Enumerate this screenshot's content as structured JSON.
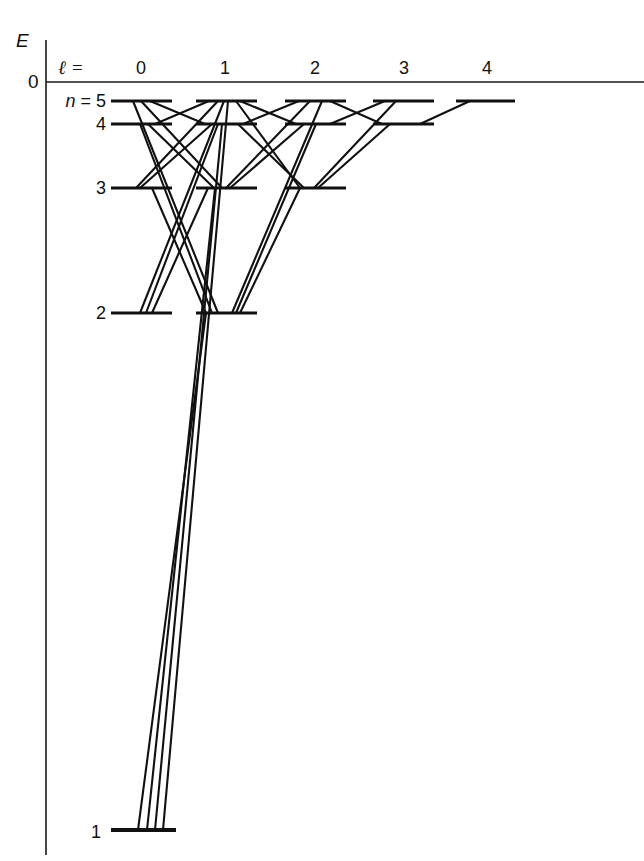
{
  "figure": {
    "kind": "grotrian-energy-level-diagram",
    "axis": {
      "energy_label": "E",
      "zero_label": "0",
      "ell_label": "ℓ",
      "ell_equals": "=",
      "ell_label_full": "ℓ ="
    },
    "columns": [
      {
        "ell": "0",
        "x": 141
      },
      {
        "ell": "1",
        "x": 225
      },
      {
        "ell": "2",
        "x": 315
      },
      {
        "ell": "3",
        "x": 404
      },
      {
        "ell": "4",
        "x": 487
      }
    ],
    "row_labels": [
      {
        "text": "n = 5",
        "n": "5",
        "n_italic": "n",
        "eq": " = ",
        "y": 101
      },
      {
        "text": "4",
        "n": "4",
        "y": 124
      },
      {
        "text": "3",
        "n": "3",
        "y": 188
      },
      {
        "text": "2",
        "n": "2",
        "y": 313
      },
      {
        "text": "1",
        "n": "1",
        "y": 830
      }
    ],
    "colors": {
      "ink": "#111111",
      "axis": "#1a1a1a",
      "background": "#ffffff"
    }
  },
  "chart_data": {
    "type": "line",
    "title": "",
    "subtitle": "",
    "xlabel": "ℓ =",
    "ylabel": "E",
    "grid": false,
    "legend": "none",
    "xlim": [
      -0.5,
      4.5
    ],
    "ylim_note": "Energy axis is qualitative: 0 at top (ionisation limit), n = 1 far below.",
    "x_tick_labels": [
      "0",
      "1",
      "2",
      "3",
      "4"
    ],
    "y_tick_labels": [
      "0"
    ],
    "annotations": [
      "E",
      "0",
      "ℓ =",
      "n = 5",
      "4",
      "3",
      "2",
      "1"
    ],
    "levels": [
      {
        "n": 5,
        "ell": 0,
        "label": "5s",
        "x1": 111,
        "x2": 172,
        "y": 101
      },
      {
        "n": 5,
        "ell": 1,
        "label": "5p",
        "x1": 196,
        "x2": 257,
        "y": 101
      },
      {
        "n": 5,
        "ell": 2,
        "label": "5d",
        "x1": 285,
        "x2": 346,
        "y": 101
      },
      {
        "n": 5,
        "ell": 3,
        "label": "5f",
        "x1": 373,
        "x2": 434,
        "y": 101
      },
      {
        "n": 5,
        "ell": 4,
        "label": "5g",
        "x1": 456,
        "x2": 515,
        "y": 101
      },
      {
        "n": 4,
        "ell": 0,
        "label": "4s",
        "x1": 111,
        "x2": 172,
        "y": 124
      },
      {
        "n": 4,
        "ell": 1,
        "label": "4p",
        "x1": 196,
        "x2": 257,
        "y": 124
      },
      {
        "n": 4,
        "ell": 2,
        "label": "4d",
        "x1": 285,
        "x2": 346,
        "y": 124
      },
      {
        "n": 4,
        "ell": 3,
        "label": "4f",
        "x1": 373,
        "x2": 434,
        "y": 124
      },
      {
        "n": 3,
        "ell": 0,
        "label": "3s",
        "x1": 111,
        "x2": 172,
        "y": 188
      },
      {
        "n": 3,
        "ell": 1,
        "label": "3p",
        "x1": 196,
        "x2": 257,
        "y": 188
      },
      {
        "n": 3,
        "ell": 2,
        "label": "3d",
        "x1": 285,
        "x2": 346,
        "y": 188
      },
      {
        "n": 2,
        "ell": 0,
        "label": "2s",
        "x1": 111,
        "x2": 172,
        "y": 313
      },
      {
        "n": 2,
        "ell": 1,
        "label": "2p",
        "x1": 196,
        "x2": 257,
        "y": 313
      },
      {
        "n": 1,
        "ell": 0,
        "label": "1s",
        "x1": 111,
        "x2": 176,
        "y": 830
      }
    ],
    "transitions": [
      {
        "from": "5g",
        "to": "4f",
        "x1": 470,
        "y1": 101,
        "x2": 420,
        "y2": 124
      },
      {
        "from": "5f",
        "to": "4d",
        "x1": 385,
        "y1": 101,
        "x2": 330,
        "y2": 124
      },
      {
        "from": "5f",
        "to": "3d",
        "x1": 396,
        "y1": 101,
        "x2": 314,
        "y2": 188
      },
      {
        "from": "5d",
        "to": "4p",
        "x1": 299,
        "y1": 101,
        "x2": 243,
        "y2": 124
      },
      {
        "from": "5d",
        "to": "4f",
        "x1": 330,
        "y1": 101,
        "x2": 382,
        "y2": 124
      },
      {
        "from": "5d",
        "to": "3p",
        "x1": 310,
        "y1": 101,
        "x2": 226,
        "y2": 188
      },
      {
        "from": "5d",
        "to": "2p",
        "x1": 322,
        "y1": 101,
        "x2": 232,
        "y2": 313
      },
      {
        "from": "5p",
        "to": "4s",
        "x1": 209,
        "y1": 101,
        "x2": 155,
        "y2": 124
      },
      {
        "from": "5p",
        "to": "4d",
        "x1": 240,
        "y1": 101,
        "x2": 296,
        "y2": 124
      },
      {
        "from": "5p",
        "to": "3s",
        "x1": 218,
        "y1": 101,
        "x2": 136,
        "y2": 188
      },
      {
        "from": "5p",
        "to": "3d",
        "x1": 236,
        "y1": 101,
        "x2": 300,
        "y2": 188
      },
      {
        "from": "5p",
        "to": "2s",
        "x1": 224,
        "y1": 101,
        "x2": 140,
        "y2": 313
      },
      {
        "from": "5p",
        "to": "1s",
        "x1": 228,
        "y1": 101,
        "x2": 163,
        "y2": 830
      },
      {
        "from": "5s",
        "to": "4p",
        "x1": 150,
        "y1": 101,
        "x2": 205,
        "y2": 124
      },
      {
        "from": "5s",
        "to": "3p",
        "x1": 141,
        "y1": 101,
        "x2": 222,
        "y2": 188
      },
      {
        "from": "5s",
        "to": "2p",
        "x1": 133,
        "y1": 101,
        "x2": 218,
        "y2": 313
      },
      {
        "from": "4f",
        "to": "3d",
        "x1": 390,
        "y1": 124,
        "x2": 318,
        "y2": 188
      },
      {
        "from": "4d",
        "to": "3p",
        "x1": 304,
        "y1": 124,
        "x2": 230,
        "y2": 188
      },
      {
        "from": "4d",
        "to": "2p",
        "x1": 316,
        "y1": 124,
        "x2": 236,
        "y2": 313
      },
      {
        "from": "4p",
        "to": "3s",
        "x1": 212,
        "y1": 124,
        "x2": 140,
        "y2": 188
      },
      {
        "from": "4p",
        "to": "3d",
        "x1": 238,
        "y1": 124,
        "x2": 304,
        "y2": 188
      },
      {
        "from": "4p",
        "to": "2s",
        "x1": 218,
        "y1": 124,
        "x2": 146,
        "y2": 313
      },
      {
        "from": "4p",
        "to": "1s",
        "x1": 222,
        "y1": 124,
        "x2": 155,
        "y2": 830
      },
      {
        "from": "4s",
        "to": "3p",
        "x1": 148,
        "y1": 124,
        "x2": 214,
        "y2": 188
      },
      {
        "from": "4s",
        "to": "2p",
        "x1": 140,
        "y1": 124,
        "x2": 212,
        "y2": 313
      },
      {
        "from": "3d",
        "to": "2p",
        "x1": 300,
        "y1": 188,
        "x2": 240,
        "y2": 313
      },
      {
        "from": "3p",
        "to": "2s",
        "x1": 208,
        "y1": 188,
        "x2": 152,
        "y2": 313
      },
      {
        "from": "3p",
        "to": "1s",
        "x1": 215,
        "y1": 188,
        "x2": 147,
        "y2": 830
      },
      {
        "from": "3s",
        "to": "2p",
        "x1": 152,
        "y1": 188,
        "x2": 206,
        "y2": 313
      },
      {
        "from": "2p",
        "to": "1s",
        "x1": 206,
        "y1": 313,
        "x2": 138,
        "y2": 830
      }
    ],
    "selection_rule_note": "Δℓ = ±1"
  }
}
